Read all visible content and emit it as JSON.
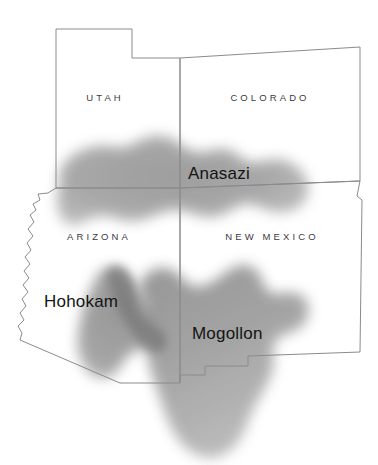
{
  "map": {
    "title": "Ancestral Southwest Cultures Map",
    "background_color": "#ffffff",
    "border_color": "#8b8b8f",
    "states": [
      {
        "id": "utah",
        "label": "UTAH",
        "label_x": 105,
        "label_y": 101
      },
      {
        "id": "colorado",
        "label": "COLORADO",
        "label_x": 270,
        "label_y": 101
      },
      {
        "id": "arizona",
        "label": "ARIZONA",
        "label_x": 99,
        "label_y": 240
      },
      {
        "id": "new-mexico",
        "label": "NEW MEXICO",
        "label_x": 272,
        "label_y": 240
      }
    ],
    "cultures": [
      {
        "id": "anasazi",
        "label": "Anasazi",
        "label_x": 188,
        "label_y": 179,
        "fill": "#9d9d9d",
        "opacity": 0.92,
        "blur": 7
      },
      {
        "id": "hohokam",
        "label": "Hohokam",
        "label_x": 44,
        "label_y": 307,
        "fill": "#8a8a8a",
        "opacity": 0.9,
        "blur": 7
      },
      {
        "id": "mogollon",
        "label": "Mogollon",
        "label_x": 192,
        "label_y": 339,
        "fill": "#9a9a9a",
        "opacity": 0.88,
        "blur": 7
      }
    ],
    "colors": {
      "state_line": "#8b8b8f",
      "culture_light": "#b4b4b4",
      "culture_mid": "#9d9d9d",
      "culture_dark": "#7b7b7b",
      "label_text": "#141414",
      "state_text": "#3b3b3f"
    }
  }
}
